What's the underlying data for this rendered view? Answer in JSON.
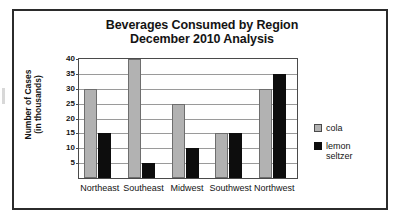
{
  "chart_data": {
    "type": "bar",
    "title": "Beverages Consumed by Region",
    "subtitle": "December 2010 Analysis",
    "title_lines": [
      "Beverages Consumed by Region",
      "December 2010 Analysis"
    ],
    "xlabel": "",
    "ylabel": "Number of Cases",
    "ylabel_lines": [
      "Number of Cases",
      "(in thousands)"
    ],
    "categories": [
      "Northeast",
      "Southeast",
      "Midwest",
      "Southwest",
      "Northwest"
    ],
    "series": [
      {
        "name": "cola",
        "color": "#b2b2b2",
        "values": [
          30,
          40,
          25,
          15,
          30
        ]
      },
      {
        "name": "lemon seltzer",
        "color": "#0d0d0d",
        "values": [
          15,
          5,
          10,
          15,
          35
        ]
      }
    ],
    "ylim": [
      0,
      40
    ],
    "yticks": [
      5,
      10,
      15,
      20,
      25,
      30,
      35,
      40
    ],
    "ytick_labels": [
      "5",
      "10",
      "15",
      "20",
      "25",
      "30",
      "35",
      "40"
    ],
    "grid": true,
    "legend_position": "right",
    "legend": [
      {
        "label": "cola",
        "label_lines": [
          "cola"
        ],
        "color": "#b2b2b2"
      },
      {
        "label": "lemon seltzer",
        "label_lines": [
          "lemon",
          "seltzer"
        ],
        "color": "#0d0d0d"
      }
    ]
  }
}
